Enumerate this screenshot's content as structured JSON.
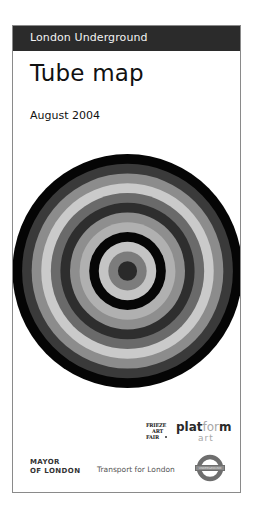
{
  "cover": {
    "header": {
      "brand": "London Underground",
      "background_color": "#2b2b2b"
    },
    "title": "Tube map",
    "date": "August 2004",
    "artwork": {
      "type": "concentric-circles-target",
      "rings_outer_to_inner": [
        "#050505",
        "#3a3a3a",
        "#8c8c8c",
        "#cacaca",
        "#6a6a6a",
        "#2e2e2e",
        "#8e8e8e",
        "#b0b0b0",
        "#060606",
        "#c4c4c4",
        "#7c7c7c",
        "#2a2a2a"
      ]
    },
    "partners": {
      "frieze": {
        "line1": "FRIEZE",
        "line2": "ART",
        "line3": "FAIR"
      },
      "platform_art": {
        "part1": "plat",
        "part2": "for",
        "part3": "m",
        "sub": "art"
      }
    },
    "footer": {
      "mayor_line1": "MAYOR",
      "mayor_line2": "OF LONDON",
      "tfl": "Transport for London",
      "roundel_label": "UNDERGROUND"
    }
  }
}
